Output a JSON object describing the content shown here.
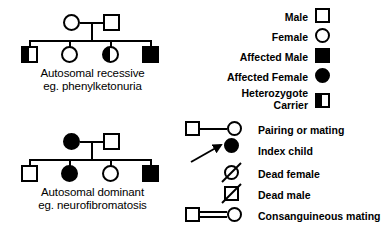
{
  "figure": {
    "title_hidden": "Pedigree symbols and inheritance patterns",
    "background_color": "#ffffff",
    "ink_color": "#000000"
  },
  "pedigrees": [
    {
      "id": "autosomal-recessive",
      "caption_line1": "Autosomal recessive",
      "caption_line2": "eg. phenylketonuria",
      "parents": [
        {
          "sex": "female",
          "shape": "circle",
          "fill": "open"
        },
        {
          "sex": "male",
          "shape": "square",
          "fill": "open"
        }
      ],
      "children": [
        {
          "sex": "male",
          "shape": "square",
          "fill": "half",
          "meaning": "carrier"
        },
        {
          "sex": "female",
          "shape": "circle",
          "fill": "open",
          "meaning": "unaffected"
        },
        {
          "sex": "female",
          "shape": "circle",
          "fill": "half",
          "meaning": "carrier"
        },
        {
          "sex": "male",
          "shape": "square",
          "fill": "filled",
          "meaning": "affected"
        }
      ]
    },
    {
      "id": "autosomal-dominant",
      "caption_line1": "Autosomal dominant",
      "caption_line2": "eg. neurofibromatosis",
      "parents": [
        {
          "sex": "female",
          "shape": "circle",
          "fill": "filled"
        },
        {
          "sex": "male",
          "shape": "square",
          "fill": "open"
        }
      ],
      "children": [
        {
          "sex": "male",
          "shape": "square",
          "fill": "open",
          "meaning": "unaffected"
        },
        {
          "sex": "female",
          "shape": "circle",
          "fill": "filled",
          "meaning": "affected"
        },
        {
          "sex": "female",
          "shape": "circle",
          "fill": "open",
          "meaning": "unaffected"
        },
        {
          "sex": "male",
          "shape": "square",
          "fill": "filled",
          "meaning": "affected"
        }
      ]
    }
  ],
  "legend_symbols": [
    {
      "label": "Male",
      "symbol": "open-square-icon"
    },
    {
      "label": "Female",
      "symbol": "open-circle-icon"
    },
    {
      "label": "Affected Male",
      "symbol": "filled-square-icon"
    },
    {
      "label": "Affected Female",
      "symbol": "filled-circle-icon"
    },
    {
      "label_line1": "Heterozygote",
      "label_line2": "Carrier",
      "label": "Heterozygote Carrier",
      "symbol": "half-filled-square-icon"
    }
  ],
  "legend_relations": [
    {
      "label": "Pairing or mating",
      "symbol": "pairing-line-icon"
    },
    {
      "label": "Index child",
      "symbol": "index-arrow-icon"
    },
    {
      "label": "Dead female",
      "symbol": "slashed-circle-icon"
    },
    {
      "label": "Dead male",
      "symbol": "slashed-square-icon"
    },
    {
      "label": "Consanguineous mating",
      "symbol": "double-pairing-line-icon"
    }
  ]
}
